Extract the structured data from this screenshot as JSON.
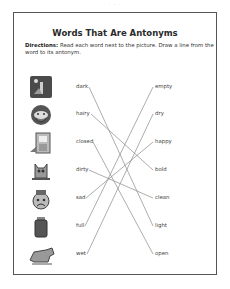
{
  "page": {
    "page_number": "· · ·",
    "title": "Words That Are Antonyms",
    "directions_label": "Directions:",
    "directions_text": " Read each word next to the picture. Draw a line from the word to its antonym."
  },
  "left_words": [
    {
      "word": "dark",
      "picture": "night-scene-icon"
    },
    {
      "word": "hairy",
      "picture": "hairy-face-icon"
    },
    {
      "word": "closed",
      "picture": "closed-door-icon"
    },
    {
      "word": "dirty",
      "picture": "dirty-cat-icon"
    },
    {
      "word": "sad",
      "picture": "sad-clown-icon"
    },
    {
      "word": "full",
      "picture": "full-jar-icon"
    },
    {
      "word": "wet",
      "picture": "wet-dog-icon"
    }
  ],
  "right_words": [
    "empty",
    "dry",
    "happy",
    "bold",
    "clean",
    "light",
    "open"
  ],
  "matches": [
    {
      "from": "dark",
      "to": "light"
    },
    {
      "from": "hairy",
      "to": "bold"
    },
    {
      "from": "closed",
      "to": "open"
    },
    {
      "from": "dirty",
      "to": "clean"
    },
    {
      "from": "sad",
      "to": "happy"
    },
    {
      "from": "full",
      "to": "empty"
    },
    {
      "from": "wet",
      "to": "dry"
    }
  ],
  "colors": {
    "line": "#8a8a8a",
    "frame": "#555555"
  }
}
